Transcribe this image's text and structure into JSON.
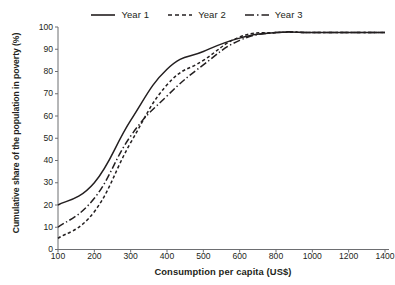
{
  "chart_data": {
    "type": "line",
    "title": "",
    "xlabel": "Consumption per capita (US$)",
    "ylabel": "Cumulative share of the population in poverty (%)",
    "categories": [
      "100",
      "200",
      "300",
      "400",
      "500",
      "600",
      "800",
      "1000",
      "1200",
      "1400"
    ],
    "x": [
      100,
      200,
      300,
      400,
      500,
      600,
      800,
      1000,
      1200,
      1400
    ],
    "ylim": [
      0,
      100
    ],
    "yticks": [
      "100",
      "90",
      "80",
      "70",
      "60",
      "50",
      "40",
      "30",
      "20",
      "10",
      "0"
    ],
    "ytick_values": [
      100,
      90,
      80,
      70,
      60,
      50,
      40,
      30,
      20,
      10,
      0
    ],
    "grid": false,
    "legend_position": "top-center",
    "axis_scale_note": "x-axis is evenly spaced categorical (700, 900, 1100, 1300 omitted)",
    "series": [
      {
        "name": "Year 1",
        "style": "solid",
        "color": "#231f20",
        "values": [
          20,
          30,
          58,
          81,
          89,
          95,
          97.5,
          97.5,
          97.5,
          97.5
        ]
      },
      {
        "name": "Year 2",
        "style": "dashed",
        "color": "#231f20",
        "values": [
          5,
          17,
          48,
          74,
          85,
          95.5,
          97.5,
          97.5,
          97.5,
          97.5
        ]
      },
      {
        "name": "Year 3",
        "style": "dash-dot",
        "color": "#231f20",
        "values": [
          10,
          23,
          51,
          69,
          83,
          94,
          97.5,
          97.5,
          97.5,
          97.5
        ]
      }
    ]
  },
  "legend": {
    "items": [
      {
        "label": "Year 1",
        "style": "solid"
      },
      {
        "label": "Year 2",
        "style": "dashed"
      },
      {
        "label": "Year 3",
        "style": "dash-dot"
      }
    ]
  },
  "colors": {
    "background": "#ffffff",
    "ink": "#231f20",
    "axis": "#6d6e71"
  }
}
